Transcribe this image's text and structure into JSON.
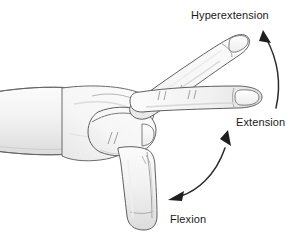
{
  "figure": {
    "background_color": "#ffffff",
    "line_color": "#5a5a5a",
    "skin_fill": "#f4f4f4",
    "shade_color": "#d8d8d8",
    "arrow_color": "#222222",
    "text_color": "#1a1a1a"
  },
  "labels": {
    "hyperextension": "Hyperextension",
    "extension": "Extension",
    "flexion": "Flexion"
  },
  "arrows": [
    {
      "name": "hyperextension-arrow",
      "style": "single-headed-curve",
      "points_to": "Hyperextension",
      "direction": "up-left"
    },
    {
      "name": "flexion-extension-arrow",
      "style": "double-headed-curve",
      "points_to": "Extension and Flexion",
      "direction": "up-right and down-left"
    }
  ],
  "anatomy": {
    "parts": [
      "forearm",
      "fist",
      "thumb",
      "raised-finger-hyperextension",
      "horizontal-finger-extension",
      "lowered-finger-flexion"
    ]
  }
}
